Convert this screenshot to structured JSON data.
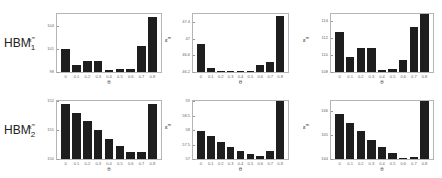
{
  "row_labels": [
    {
      "base": "HBM",
      "sub": "1"
    },
    {
      "base": "HBM",
      "sub": "2"
    }
  ],
  "chart_data": [
    {
      "type": "bar",
      "row": 0,
      "col": 0,
      "title": "",
      "xlabel": "θ",
      "ylabel": "ε",
      "ylabel_sup": "m",
      "categories": [
        "0",
        "0.1",
        "0.2",
        "0.3",
        "0.4",
        "0.5",
        "0.6",
        "0.7",
        "0.8"
      ],
      "values": [
        101.0,
        98.9,
        99.4,
        99.4,
        98.25,
        98.4,
        98.4,
        101.4,
        105.1
      ],
      "ylim": [
        98,
        105.5
      ],
      "yticks": [
        "98",
        "101",
        "104"
      ],
      "ytick_values": [
        98,
        101,
        104
      ]
    },
    {
      "type": "bar",
      "row": 0,
      "col": 1,
      "title": "",
      "xlabel": "θ",
      "ylabel": "ε",
      "ylabel_sup": "m",
      "categories": [
        "0",
        "0.1",
        "0.2",
        "0.3",
        "0.4",
        "0.5",
        "0.6",
        "0.7",
        "0.8"
      ],
      "values": [
        46.87,
        46.3,
        46.21,
        46.23,
        46.21,
        46.23,
        46.38,
        46.45,
        47.55
      ],
      "ylim": [
        46.2,
        47.6
      ],
      "yticks": [
        "46.2",
        "46.6",
        "47",
        "47.4"
      ],
      "ytick_values": [
        46.2,
        46.6,
        47.0,
        47.4
      ]
    },
    {
      "type": "bar",
      "row": 0,
      "col": 2,
      "title": "",
      "xlabel": "θ",
      "ylabel": "ε",
      "ylabel_sup": "m",
      "categories": [
        "0",
        "0.1",
        "0.2",
        "0.3",
        "0.4",
        "0.5",
        "0.6",
        "0.7",
        "0.8"
      ],
      "values": [
        112.7,
        109.8,
        110.8,
        110.8,
        108.2,
        108.4,
        109.4,
        113.3,
        114.8
      ],
      "ylim": [
        108,
        114.8
      ],
      "yticks": [
        "108",
        "110",
        "112",
        "114"
      ],
      "ytick_values": [
        108,
        110,
        112,
        114
      ]
    },
    {
      "type": "bar",
      "row": 1,
      "col": 0,
      "title": "",
      "xlabel": "θ",
      "ylabel": "ε",
      "ylabel_sup": "m",
      "categories": [
        "0",
        "0.1",
        "0.2",
        "0.3",
        "0.4",
        "0.5",
        "0.6",
        "0.7",
        "0.8"
      ],
      "values": [
        151.9,
        151.6,
        151.3,
        151.0,
        150.7,
        150.45,
        150.25,
        150.25,
        151.9
      ],
      "ylim": [
        150,
        152
      ],
      "yticks": [
        "150",
        "151",
        "152"
      ],
      "ytick_values": [
        150,
        151,
        152
      ]
    },
    {
      "type": "bar",
      "row": 1,
      "col": 1,
      "title": "",
      "xlabel": "θ",
      "ylabel": "ε",
      "ylabel_sup": "m",
      "categories": [
        "0",
        "0.1",
        "0.2",
        "0.3",
        "0.4",
        "0.5",
        "0.6",
        "0.7",
        "0.8"
      ],
      "values": [
        57.95,
        57.8,
        57.58,
        57.42,
        57.27,
        57.16,
        57.11,
        57.27,
        59.0
      ],
      "ylim": [
        57,
        59
      ],
      "yticks": [
        "57",
        "57.5",
        "58",
        "58.5",
        "59"
      ],
      "ytick_values": [
        57,
        57.5,
        58,
        58.5,
        59
      ]
    },
    {
      "type": "bar",
      "row": 1,
      "col": 2,
      "title": "",
      "xlabel": "θ",
      "ylabel": "ε",
      "ylabel_sup": "m",
      "categories": [
        "0",
        "0.1",
        "0.2",
        "0.3",
        "0.4",
        "0.5",
        "0.6",
        "0.7",
        "0.8"
      ],
      "values": [
        165.85,
        165.5,
        165.15,
        164.8,
        164.5,
        164.25,
        164.05,
        164.1,
        166.4
      ],
      "ylim": [
        164,
        166.4
      ],
      "yticks": [
        "164",
        "165",
        "166"
      ],
      "ytick_values": [
        164,
        165,
        166
      ]
    }
  ]
}
